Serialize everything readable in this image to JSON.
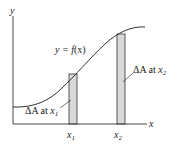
{
  "diagram": {
    "type": "area-strips-under-curve",
    "axes": {
      "x_label": "x",
      "y_label": "y"
    },
    "curve": {
      "label_prefix": "y = ",
      "label_func": "f",
      "label_arg": "(x)"
    },
    "strips": [
      {
        "label_delta": "ΔA",
        "label_at": " at ",
        "label_var": "x",
        "label_sub": "1",
        "tick_var": "x",
        "tick_sub": "1"
      },
      {
        "label_delta": "ΔA",
        "label_at": " at ",
        "label_var": "x",
        "label_sub": "2",
        "tick_var": "x",
        "tick_sub": "2"
      }
    ],
    "colors": {
      "line": "#333333",
      "strip_fill": "#d9d9d9",
      "background": "#ffffff"
    }
  }
}
